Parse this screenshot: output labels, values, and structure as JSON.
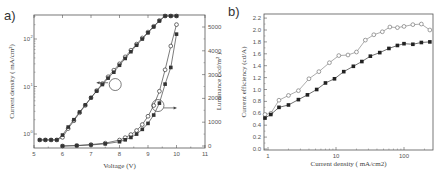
{
  "panel_a": {
    "label": "a)",
    "xlabel": "Voltage (V)",
    "ylabel_left": "Current density ( mA/cm²)",
    "ylabel_right": "Luminance ( cd/m² )"
  },
  "panel_b": {
    "label": "b)",
    "xlabel": "Current density ( mA/cm2)",
    "ylabel": "Current efficiency (cd/A)",
    "ghost_ylabel": "Luminance ( cd/m²)"
  },
  "chart_data": [
    {
      "type": "line",
      "title": "a)",
      "xlabel": "Voltage (V)",
      "ylabel": "Current density ( mA/cm2)",
      "ylabel_right": "Luminance ( cd/m2 )",
      "xlim": [
        5,
        11
      ],
      "xticks": [
        5,
        6,
        7,
        8,
        9,
        10,
        11
      ],
      "ylim_left": [
        0.6,
        3
      ],
      "yscale_left": "log",
      "yticks_left": [
        "10^0",
        "10^1",
        "10^2"
      ],
      "ylim_right": [
        0,
        5500
      ],
      "yticks_right": [
        0,
        1000,
        2000,
        3000,
        4000,
        5000
      ],
      "grid": false,
      "annotations": [
        "circle + left arrow on current density curves near 7.9 V",
        "circle + right arrow on luminance curves near 9.4 V"
      ],
      "series": [
        {
          "name": "Current density (open circles)",
          "axis": "left",
          "marker": "open-circle",
          "x": [
            5.2,
            5.4,
            5.6,
            5.8,
            6.0,
            6.2,
            6.4,
            6.6,
            6.8,
            7.0,
            7.2,
            7.4,
            7.6,
            7.8,
            8.0,
            8.2,
            8.4,
            8.6,
            8.8,
            9.0,
            9.2,
            9.4,
            9.6,
            9.8,
            10.0
          ],
          "y": [
            0.75,
            0.75,
            0.75,
            0.75,
            0.85,
            1.3,
            1.9,
            2.8,
            4.0,
            5.8,
            8.2,
            11.5,
            16,
            22,
            30,
            42,
            58,
            78,
            105,
            140,
            185,
            245,
            320,
            410,
            520
          ]
        },
        {
          "name": "Current density (filled squares)",
          "axis": "left",
          "marker": "filled-square",
          "x": [
            5.2,
            5.4,
            5.6,
            5.8,
            6.0,
            6.2,
            6.4,
            6.6,
            6.8,
            7.0,
            7.2,
            7.4,
            7.6,
            7.8,
            8.0,
            8.2,
            8.4,
            8.6,
            8.8,
            9.0,
            9.2,
            9.4,
            9.6,
            9.8,
            10.0
          ],
          "y": [
            0.75,
            0.75,
            0.75,
            0.75,
            0.95,
            1.4,
            2.0,
            2.9,
            4.1,
            5.8,
            8.0,
            11,
            15,
            20,
            28,
            39,
            54,
            74,
            100,
            135,
            180,
            240,
            315,
            405,
            515
          ]
        },
        {
          "name": "Luminance (open circles)",
          "axis": "right",
          "marker": "open-circle",
          "x": [
            6.0,
            6.5,
            7.0,
            7.5,
            8.0,
            8.2,
            8.4,
            8.6,
            8.8,
            9.0,
            9.2,
            9.4,
            9.6,
            9.8,
            10.0
          ],
          "y": [
            0,
            20,
            60,
            120,
            250,
            350,
            480,
            650,
            900,
            1250,
            1700,
            2300,
            3200,
            4200,
            5100
          ]
        },
        {
          "name": "Luminance (filled squares)",
          "axis": "right",
          "marker": "filled-square",
          "x": [
            6.0,
            6.5,
            7.0,
            7.5,
            8.0,
            8.2,
            8.4,
            8.6,
            8.8,
            9.0,
            9.2,
            9.4,
            9.6,
            9.8,
            10.0
          ],
          "y": [
            0,
            15,
            45,
            90,
            180,
            260,
            360,
            500,
            700,
            950,
            1300,
            1800,
            2600,
            3300,
            4700
          ]
        }
      ]
    },
    {
      "type": "line",
      "title": "b)",
      "xlabel": "Current density ( mA/cm2)",
      "ylabel": "Current efficiency (cd/A)",
      "xscale": "log",
      "xlim": [
        0.85,
        260
      ],
      "xticks": [
        1,
        10,
        100
      ],
      "ylim": [
        0.0,
        2.3
      ],
      "yticks": [
        0.0,
        0.2,
        0.4,
        0.6,
        0.8,
        1.0,
        1.2,
        1.4,
        1.6,
        1.8,
        2.0,
        2.2
      ],
      "grid": false,
      "series": [
        {
          "name": "open circles",
          "marker": "open-circle",
          "x": [
            0.85,
            1.1,
            1.45,
            2.0,
            2.8,
            4.0,
            5.6,
            8.0,
            11,
            15,
            20,
            27,
            36,
            48,
            62,
            80,
            100,
            135,
            180,
            240
          ],
          "y": [
            0.58,
            0.6,
            0.82,
            0.9,
            0.98,
            1.18,
            1.3,
            1.45,
            1.57,
            1.58,
            1.63,
            1.83,
            1.92,
            1.97,
            2.05,
            2.04,
            2.06,
            2.09,
            2.1,
            2.0
          ]
        },
        {
          "name": "filled squares",
          "marker": "filled-square",
          "x": [
            0.85,
            1.1,
            1.45,
            2.0,
            2.8,
            3.8,
            5.2,
            7.0,
            9.5,
            13,
            18,
            24,
            32,
            44,
            60,
            80,
            100,
            135,
            180,
            240
          ],
          "y": [
            0.52,
            0.58,
            0.7,
            0.74,
            0.83,
            0.91,
            1.0,
            1.11,
            1.18,
            1.3,
            1.39,
            1.47,
            1.56,
            1.62,
            1.69,
            1.74,
            1.77,
            1.76,
            1.79,
            1.8
          ]
        }
      ]
    }
  ]
}
